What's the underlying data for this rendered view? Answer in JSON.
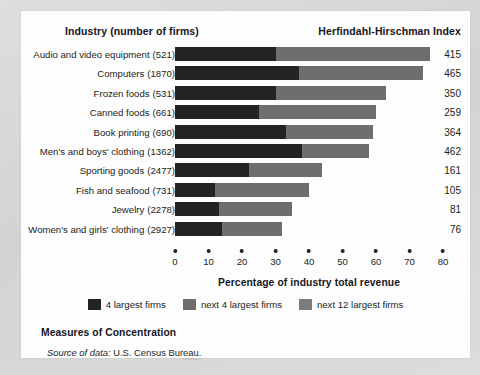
{
  "header": {
    "industry_label": "Industry (number of firms)",
    "hhi_label": "Herfindahl-Hirschman Index"
  },
  "footer": {
    "title": "Measures of Concentration",
    "source_prefix": "Source of data:",
    "source_text": "U.S. Census Bureau."
  },
  "legend": {
    "items": [
      {
        "label": "4 largest firms",
        "color": "#232323",
        "name": "legend-top4"
      },
      {
        "label": "next 4 largest firms",
        "color": "#6e6e6e",
        "name": "legend-next4"
      },
      {
        "label": "next 12 largest firms",
        "color": "#7c7c7c",
        "name": "legend-next12"
      }
    ]
  },
  "chart_data": {
    "type": "bar",
    "orientation": "horizontal",
    "stacked": true,
    "title": "Measures of Concentration",
    "xlabel": "Percentage of industry total revenue",
    "ylabel": "Industry (number of firms)",
    "xlim": [
      0,
      80
    ],
    "xticks": [
      0,
      10,
      20,
      30,
      40,
      50,
      60,
      70,
      80
    ],
    "grid": false,
    "legend_position": "bottom-center",
    "series": [
      {
        "name": "4 largest firms",
        "color": "#232323",
        "values": [
          30,
          37,
          30,
          25,
          33,
          38,
          22,
          12,
          13,
          14
        ]
      },
      {
        "name": "next 4 largest firms",
        "color": "#6e6e6e",
        "values": [
          46,
          37,
          33,
          35,
          26,
          20,
          22,
          28,
          22,
          18
        ]
      },
      {
        "name": "next 12 largest firms",
        "color": "#7c7c7c",
        "values": [
          0,
          0,
          0,
          0,
          0,
          0,
          0,
          0,
          0,
          0
        ]
      }
    ],
    "categories": [
      "Audio and video equipment",
      "Computers",
      "Frozen foods",
      "Canned foods",
      "Book printing",
      "Men's and boys' clothing",
      "Sporting goods",
      "Fish and seafood",
      "Jewelry",
      "Women's and girls' clothing"
    ],
    "rows": [
      {
        "industry": "Audio and video equipment",
        "firms": "(521)",
        "top4": 30,
        "next4": 46,
        "next12": 0,
        "total": 76,
        "hhi": "415"
      },
      {
        "industry": "Computers",
        "firms": "(1870)",
        "top4": 37,
        "next4": 37,
        "next12": 0,
        "total": 74,
        "hhi": "465"
      },
      {
        "industry": "Frozen foods",
        "firms": "(531)",
        "top4": 30,
        "next4": 33,
        "next12": 0,
        "total": 63,
        "hhi": "350"
      },
      {
        "industry": "Canned foods",
        "firms": "(661)",
        "top4": 25,
        "next4": 35,
        "next12": 0,
        "total": 60,
        "hhi": "259"
      },
      {
        "industry": "Book printing",
        "firms": "(690)",
        "top4": 33,
        "next4": 26,
        "next12": 0,
        "total": 59,
        "hhi": "364"
      },
      {
        "industry": "Men's and boys' clothing",
        "firms": "(1362)",
        "top4": 38,
        "next4": 20,
        "next12": 0,
        "total": 58,
        "hhi": "462"
      },
      {
        "industry": "Sporting goods",
        "firms": "(2477)",
        "top4": 22,
        "next4": 22,
        "next12": 0,
        "total": 44,
        "hhi": "161"
      },
      {
        "industry": "Fish and seafood",
        "firms": "(731)",
        "top4": 12,
        "next4": 28,
        "next12": 0,
        "total": 40,
        "hhi": "105"
      },
      {
        "industry": "Jewelry",
        "firms": "(2278)",
        "top4": 13,
        "next4": 22,
        "next12": 0,
        "total": 35,
        "hhi": "81"
      },
      {
        "industry": "Women's and girls' clothing",
        "firms": "(2927)",
        "top4": 14,
        "next4": 18,
        "next12": 0,
        "total": 32,
        "hhi": "76"
      }
    ]
  }
}
